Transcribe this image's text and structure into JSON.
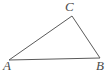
{
  "figure": {
    "kind": "geometry-diagram",
    "width": 107,
    "height": 74,
    "background_color": "#ffffff",
    "stroke_color": "#5a5a5a",
    "stroke_width": 1,
    "fill": "none",
    "labels": {
      "a": "A",
      "b": "B",
      "c": "C"
    },
    "vertices": [
      {
        "name": "A",
        "x": 9,
        "y": 60
      },
      {
        "name": "B",
        "x": 100,
        "y": 58
      },
      {
        "name": "C",
        "x": 72,
        "y": 16
      }
    ],
    "edges": [
      {
        "name": "AB",
        "from": "A",
        "to": "B"
      },
      {
        "name": "BC",
        "from": "B",
        "to": "C"
      },
      {
        "name": "CA",
        "from": "C",
        "to": "A"
      }
    ],
    "polygon_points": "9,60 72,16 100,58"
  }
}
